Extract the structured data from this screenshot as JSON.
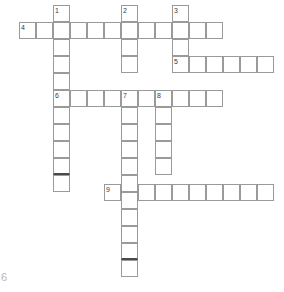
{
  "puzzle": {
    "title": "crossword-grid",
    "cell_size": 17,
    "origin_x": 2,
    "origin_y": 5,
    "colors": {
      "cell_border": "#9a9a9a",
      "separator": "#4a4a4a",
      "background": "#ffffff",
      "number": "#3a3a3a",
      "corner_mark": "#b8b8b8"
    },
    "corner_mark": "6",
    "entries": [
      {
        "number": "1",
        "direction": "down",
        "col": 3,
        "row": 0,
        "length": 11
      },
      {
        "number": "2",
        "direction": "down",
        "col": 7,
        "row": 0,
        "length": 4
      },
      {
        "number": "3",
        "direction": "down",
        "col": 10,
        "row": 0,
        "length": 3
      },
      {
        "number": "4",
        "direction": "across",
        "col": 1,
        "row": 1,
        "length": 12
      },
      {
        "number": "5",
        "direction": "across",
        "col": 10,
        "row": 3,
        "length": 6
      },
      {
        "number": "6",
        "direction": "across",
        "col": 3,
        "row": 5,
        "length": 10
      },
      {
        "number": "7",
        "direction": "down",
        "col": 7,
        "row": 5,
        "length": 11
      },
      {
        "number": "8",
        "direction": "down",
        "col": 9,
        "row": 5,
        "length": 5
      },
      {
        "number": "9",
        "direction": "across",
        "col": 6,
        "row": 10,
        "length": 10
      }
    ],
    "cells": [
      {
        "name": "cell-c3-r0",
        "x": 53,
        "y": 5,
        "num": "1",
        "sep": false
      },
      {
        "name": "cell-c3-r1",
        "x": 53,
        "y": 22,
        "num": null,
        "sep": false
      },
      {
        "name": "cell-c3-r2",
        "x": 53,
        "y": 39,
        "num": null,
        "sep": false
      },
      {
        "name": "cell-c3-r3",
        "x": 53,
        "y": 56,
        "num": null,
        "sep": false
      },
      {
        "name": "cell-c3-r4",
        "x": 53,
        "y": 73,
        "num": null,
        "sep": false
      },
      {
        "name": "cell-c3-r5",
        "x": 53,
        "y": 90,
        "num": "6",
        "sep": false
      },
      {
        "name": "cell-c3-r6",
        "x": 53,
        "y": 107,
        "num": null,
        "sep": false
      },
      {
        "name": "cell-c3-r7",
        "x": 53,
        "y": 124,
        "num": null,
        "sep": false
      },
      {
        "name": "cell-c3-r8",
        "x": 53,
        "y": 141,
        "num": null,
        "sep": false
      },
      {
        "name": "cell-c3-r9",
        "x": 53,
        "y": 158,
        "num": null,
        "sep": true
      },
      {
        "name": "cell-c3-r10",
        "x": 53,
        "y": 175,
        "num": null,
        "sep": false
      },
      {
        "name": "cell-c7-r0",
        "x": 121,
        "y": 5,
        "num": "2",
        "sep": false
      },
      {
        "name": "cell-c7-r1",
        "x": 121,
        "y": 22,
        "num": null,
        "sep": false
      },
      {
        "name": "cell-c7-r2",
        "x": 121,
        "y": 39,
        "num": null,
        "sep": false
      },
      {
        "name": "cell-c7-r3",
        "x": 121,
        "y": 56,
        "num": null,
        "sep": false
      },
      {
        "name": "cell-c10-r0",
        "x": 172,
        "y": 5,
        "num": "3",
        "sep": false
      },
      {
        "name": "cell-c10-r1",
        "x": 172,
        "y": 22,
        "num": null,
        "sep": false
      },
      {
        "name": "cell-c10-r2",
        "x": 172,
        "y": 39,
        "num": null,
        "sep": false
      },
      {
        "name": "cell-c1-r1",
        "x": 19,
        "y": 22,
        "num": "4",
        "sep": false
      },
      {
        "name": "cell-c2-r1",
        "x": 36,
        "y": 22,
        "num": null,
        "sep": false
      },
      {
        "name": "cell-c4-r1",
        "x": 70,
        "y": 22,
        "num": null,
        "sep": false
      },
      {
        "name": "cell-c5-r1",
        "x": 87,
        "y": 22,
        "num": null,
        "sep": false
      },
      {
        "name": "cell-c6-r1",
        "x": 104,
        "y": 22,
        "num": null,
        "sep": false
      },
      {
        "name": "cell-c8-r1",
        "x": 138,
        "y": 22,
        "num": null,
        "sep": false
      },
      {
        "name": "cell-c9-r1",
        "x": 155,
        "y": 22,
        "num": null,
        "sep": false
      },
      {
        "name": "cell-c11-r1",
        "x": 189,
        "y": 22,
        "num": null,
        "sep": false
      },
      {
        "name": "cell-c12-r1",
        "x": 206,
        "y": 22,
        "num": null,
        "sep": false
      },
      {
        "name": "cell-c10-r3",
        "x": 172,
        "y": 56,
        "num": "5",
        "sep": false
      },
      {
        "name": "cell-c11-r3",
        "x": 189,
        "y": 56,
        "num": null,
        "sep": false
      },
      {
        "name": "cell-c12-r3",
        "x": 206,
        "y": 56,
        "num": null,
        "sep": false
      },
      {
        "name": "cell-c13-r3",
        "x": 223,
        "y": 56,
        "num": null,
        "sep": false
      },
      {
        "name": "cell-c14-r3",
        "x": 240,
        "y": 56,
        "num": null,
        "sep": false
      },
      {
        "name": "cell-c15-r3",
        "x": 257,
        "y": 56,
        "num": null,
        "sep": false
      },
      {
        "name": "cell-c4-r5",
        "x": 70,
        "y": 90,
        "num": null,
        "sep": false
      },
      {
        "name": "cell-c5-r5",
        "x": 87,
        "y": 90,
        "num": null,
        "sep": false
      },
      {
        "name": "cell-c6-r5",
        "x": 104,
        "y": 90,
        "num": null,
        "sep": false
      },
      {
        "name": "cell-c7-r5",
        "x": 121,
        "y": 90,
        "num": "7",
        "sep": false
      },
      {
        "name": "cell-c8-r5",
        "x": 138,
        "y": 90,
        "num": null,
        "sep": false
      },
      {
        "name": "cell-c9-r5",
        "x": 155,
        "y": 90,
        "num": "8",
        "sep": false
      },
      {
        "name": "cell-c10-r5",
        "x": 172,
        "y": 90,
        "num": null,
        "sep": false
      },
      {
        "name": "cell-c11-r5",
        "x": 189,
        "y": 90,
        "num": null,
        "sep": false
      },
      {
        "name": "cell-c12-r5",
        "x": 206,
        "y": 90,
        "num": null,
        "sep": false
      },
      {
        "name": "cell-c7-r6",
        "x": 121,
        "y": 107,
        "num": null,
        "sep": false
      },
      {
        "name": "cell-c7-r7",
        "x": 121,
        "y": 124,
        "num": null,
        "sep": false
      },
      {
        "name": "cell-c7-r8",
        "x": 121,
        "y": 141,
        "num": null,
        "sep": false
      },
      {
        "name": "cell-c7-r9",
        "x": 121,
        "y": 158,
        "num": null,
        "sep": false
      },
      {
        "name": "cell-c7-r10",
        "x": 121,
        "y": 175,
        "num": null,
        "sep": false
      },
      {
        "name": "cell-c7-r11",
        "x": 121,
        "y": 192,
        "num": null,
        "sep": false
      },
      {
        "name": "cell-c7-r12",
        "x": 121,
        "y": 209,
        "num": null,
        "sep": false
      },
      {
        "name": "cell-c7-r13",
        "x": 121,
        "y": 226,
        "num": null,
        "sep": false
      },
      {
        "name": "cell-c7-r14",
        "x": 121,
        "y": 243,
        "num": null,
        "sep": true
      },
      {
        "name": "cell-c7-r15",
        "x": 121,
        "y": 260,
        "num": null,
        "sep": false
      },
      {
        "name": "cell-c9-r6",
        "x": 155,
        "y": 107,
        "num": null,
        "sep": false
      },
      {
        "name": "cell-c9-r7",
        "x": 155,
        "y": 124,
        "num": null,
        "sep": false
      },
      {
        "name": "cell-c9-r8",
        "x": 155,
        "y": 141,
        "num": null,
        "sep": false
      },
      {
        "name": "cell-c9-r9",
        "x": 155,
        "y": 158,
        "num": null,
        "sep": false
      },
      {
        "name": "cell-c6-r10",
        "x": 104,
        "y": 184,
        "num": "9",
        "sep": false
      },
      {
        "name": "cell-c8-r10",
        "x": 138,
        "y": 184,
        "num": null,
        "sep": false
      },
      {
        "name": "cell-c9-r10",
        "x": 155,
        "y": 184,
        "num": null,
        "sep": false
      },
      {
        "name": "cell-c10-r10",
        "x": 172,
        "y": 184,
        "num": null,
        "sep": false
      },
      {
        "name": "cell-c11-r10",
        "x": 189,
        "y": 184,
        "num": null,
        "sep": false
      },
      {
        "name": "cell-c12-r10",
        "x": 206,
        "y": 184,
        "num": null,
        "sep": false
      },
      {
        "name": "cell-c13-r10",
        "x": 223,
        "y": 184,
        "num": null,
        "sep": false
      },
      {
        "name": "cell-c14-r10",
        "x": 240,
        "y": 184,
        "num": null,
        "sep": false
      },
      {
        "name": "cell-c15-r10",
        "x": 257,
        "y": 184,
        "num": null,
        "sep": false
      }
    ]
  }
}
